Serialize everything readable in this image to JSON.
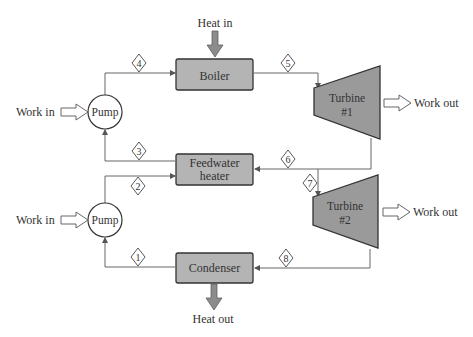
{
  "diagram": {
    "type": "Rankine cycle with regeneration (open feedwater heater)",
    "components": {
      "boiler": {
        "label": "Boiler"
      },
      "feedwater_heater": {
        "label_line1": "Feedwater",
        "label_line2": "heater"
      },
      "condenser": {
        "label": "Condenser"
      },
      "pump_high": {
        "label": "Pump"
      },
      "pump_low": {
        "label": "Pump"
      },
      "turbine1": {
        "label_line1": "Turbine",
        "label_line2": "#1"
      },
      "turbine2": {
        "label_line1": "Turbine",
        "label_line2": "#2"
      }
    },
    "energy_labels": {
      "heat_in": "Heat in",
      "heat_out": "Heat out",
      "work_in_high": "Work in",
      "work_in_low": "Work in",
      "work_out_1": "Work out",
      "work_out_2": "Work out"
    },
    "state_points": [
      "1",
      "2",
      "3",
      "4",
      "5",
      "6",
      "7",
      "8"
    ],
    "colors": {
      "component_fill": "#b4b4b4",
      "turbine_fill": "#9a9a9a",
      "heat_arrow_fill": "#8c8c8c",
      "line": "#555555",
      "text": "#333333"
    }
  }
}
